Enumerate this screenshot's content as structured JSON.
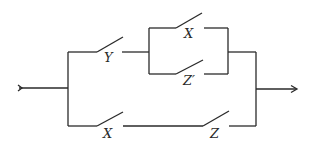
{
  "diagram": {
    "type": "switching-circuit",
    "switches": [
      {
        "id": "sw-y",
        "label": "Y",
        "branch": "upper",
        "position": "series-first"
      },
      {
        "id": "sw-x-upper",
        "label": "X",
        "branch": "upper-parallel-top"
      },
      {
        "id": "sw-zprime",
        "label": "Z′",
        "branch": "upper-parallel-bottom"
      },
      {
        "id": "sw-x-lower",
        "label": "X",
        "branch": "lower",
        "position": "series-first"
      },
      {
        "id": "sw-z",
        "label": "Z",
        "branch": "lower",
        "position": "series-second"
      }
    ],
    "terminals": {
      "input": "input-arrow",
      "output": "output-arrow"
    },
    "colors": {
      "line": "#2a2a2a",
      "background": "#ffffff"
    }
  }
}
